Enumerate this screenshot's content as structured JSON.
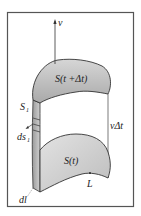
{
  "labels": {
    "velocity": "v⃗",
    "surface_top": "S(t +Δt)",
    "surface_bottom": "S(t)",
    "side_surface": "S",
    "side_surface_sub": "1",
    "area_element": "ds",
    "area_element_sub": "1",
    "displacement": "vΔt",
    "boundary": "L",
    "line_element": "dl"
  },
  "colors": {
    "frame": "#444444",
    "fill": "#c8c8c8",
    "stroke": "#333333"
  }
}
